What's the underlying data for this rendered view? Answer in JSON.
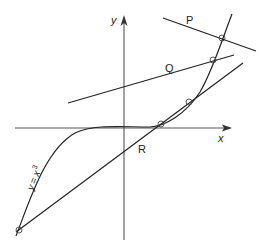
{
  "diagram": {
    "curve_label": "y = x³",
    "curve_label_y": "y",
    "curve_label_eq": "=",
    "curve_label_x": "x",
    "curve_label_exp": "3",
    "x_axis_label": "x",
    "y_axis_label": "y",
    "lines": [
      {
        "id": "P",
        "label": "P"
      },
      {
        "id": "Q",
        "label": "Q"
      },
      {
        "id": "R",
        "label": "R"
      }
    ],
    "colors": {
      "stroke": "#222222",
      "axis": "#555555",
      "background": "#ffffff"
    }
  }
}
